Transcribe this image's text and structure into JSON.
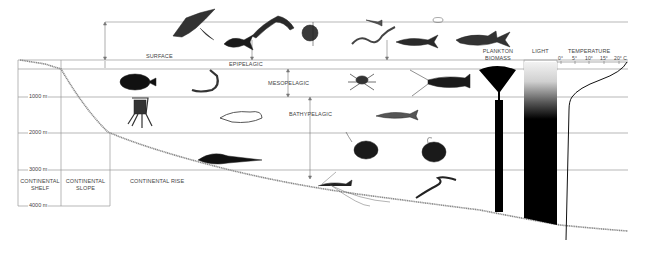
{
  "diagram": {
    "zones": {
      "surface": "SURFACE",
      "epipelagic": "EPIPELAGIC",
      "mesopelagic": "MESOPELAGIC",
      "bathypelagic": "BATHYPELAGIC"
    },
    "depth_marks": [
      "1000 m",
      "2000 m",
      "3000 m",
      "4000 m"
    ],
    "seafloor_regions": {
      "shelf_line1": "CONTINENTAL",
      "shelf_line2": "SHELF",
      "slope_line1": "CONTINENTAL",
      "slope_line2": "SLOPE",
      "rise": "CONTINENTAL RISE"
    },
    "columns": {
      "plankton_line1": "PLANKTON",
      "plankton_line2": "BIOMASS",
      "light": "LIGHT",
      "temperature": "TEMPERATURE"
    },
    "temperature_ticks": [
      "0°",
      "5°",
      "10°",
      "15°",
      "20° C"
    ],
    "organisms": [
      "manta ray",
      "jack fish",
      "marlin",
      "sunfish",
      "small fish",
      "eel",
      "tuna",
      "small jellyfish",
      "shark",
      "anglerfish (dark)",
      "shrimp",
      "spider crab",
      "lobster",
      "squid",
      "cuttlefish",
      "dragonfish",
      "anglerfish",
      "deep-sea anglerfish",
      "rattail fish",
      "tripod fish",
      "gulper eel"
    ]
  }
}
